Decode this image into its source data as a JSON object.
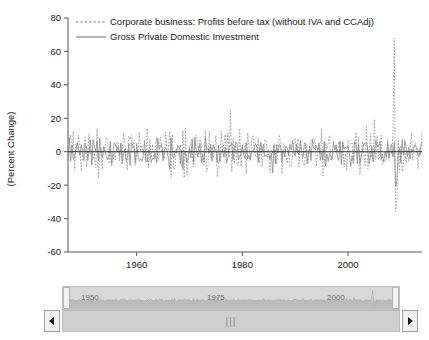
{
  "chart_data": {
    "type": "line",
    "title": "",
    "xlabel": "",
    "ylabel": "(Percent Change)",
    "ylim": [
      -60,
      80
    ],
    "xlim": [
      1947,
      2014
    ],
    "yticks": [
      -60,
      -40,
      -20,
      0,
      20,
      40,
      60,
      80
    ],
    "xticks": [
      1960,
      1980,
      2000
    ],
    "grid": false,
    "legend_position": "top-left",
    "series": [
      {
        "name": "Corporate business: Profits before tax (without IVA and CCAdj)",
        "style": "dashed",
        "color": "#8f8f8f",
        "seed": 1947,
        "amplitude": 16,
        "notes": "Quarterly percent change; extreme spike of about +68 in 2008 Q4 and trough of about -50 in 2009 Q1"
      },
      {
        "name": "Gross Private Domestic Investment",
        "style": "solid",
        "color": "#8b8b8b",
        "seed": 2207,
        "amplitude": 9,
        "notes": "Quarterly percent change; deep trough near -28 in 2009"
      }
    ],
    "annotations": [
      {
        "label": "2008 profit spike",
        "x": 2008.75,
        "y": 68
      },
      {
        "label": "2009 profit trough",
        "x": 2009.0,
        "y": -50
      }
    ]
  },
  "axis": {
    "y_title": "(Percent Change)",
    "y_tick_labels": [
      "80",
      "60",
      "40",
      "20",
      "0",
      "-20",
      "-40",
      "-60"
    ],
    "x_tick_labels": [
      "1960",
      "1980",
      "2000"
    ]
  },
  "legend": {
    "items": [
      {
        "label": "Corporate business: Profits before tax (without IVA and CCAdj)",
        "style": "dashed"
      },
      {
        "label": "Gross Private Domestic Investment",
        "style": "solid"
      }
    ]
  },
  "navigator": {
    "tick_labels": [
      "1950",
      "1975",
      "2000"
    ],
    "left_handle": "left-range-handle",
    "right_handle": "right-range-handle"
  },
  "scrollbar": {
    "grip": "|||",
    "left_arrow": "◀",
    "right_arrow": "▶"
  }
}
